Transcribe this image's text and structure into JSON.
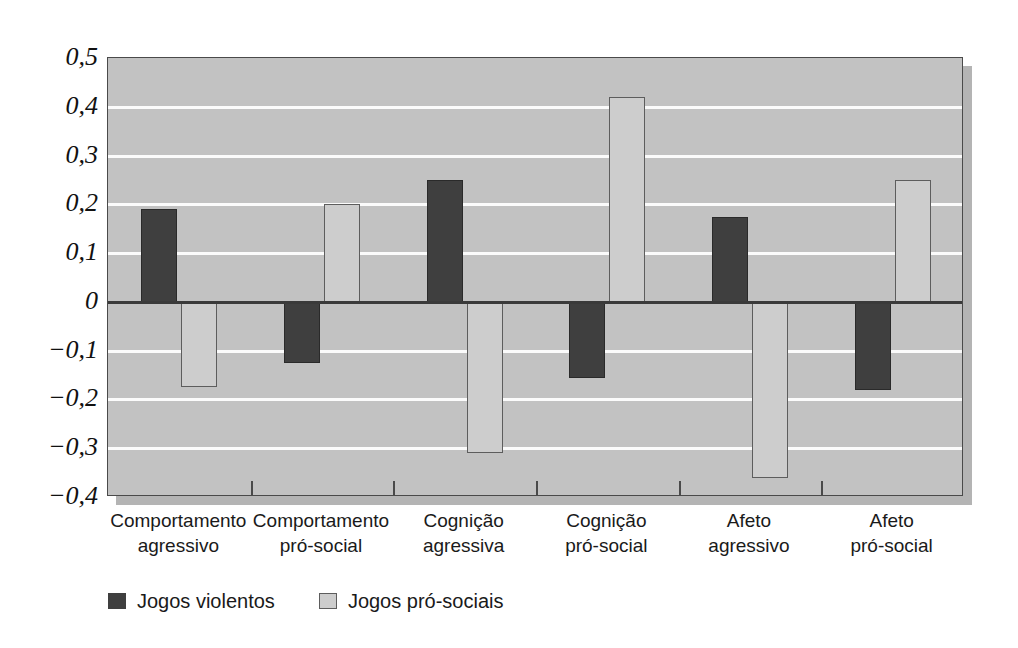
{
  "chart_data": {
    "type": "bar",
    "title": "",
    "xlabel": "",
    "ylabel": "",
    "ylim": [
      -0.4,
      0.5
    ],
    "grid": true,
    "legend_position": "bottom-left",
    "decimal_separator": ",",
    "categories": [
      {
        "line1": "Comportamento",
        "line2": "agressivo"
      },
      {
        "line1": "Comportamento",
        "line2": "pró-social"
      },
      {
        "line1": "Cognição",
        "line2": "agressiva"
      },
      {
        "line1": "Cognição",
        "line2": "pró-social"
      },
      {
        "line1": "Afeto",
        "line2": "agressivo"
      },
      {
        "line1": "Afeto",
        "line2": "pró-social"
      }
    ],
    "series": [
      {
        "name": "Jogos violentos",
        "color": "#3f3f3f",
        "values": [
          0.19,
          -0.125,
          0.25,
          -0.155,
          0.175,
          -0.18
        ]
      },
      {
        "name": "Jogos pró-sociais",
        "color": "#cdcdcd",
        "values": [
          -0.175,
          0.2,
          -0.31,
          0.42,
          -0.36,
          0.25
        ]
      }
    ],
    "yticks": [
      {
        "value": 0.5,
        "label": "0,5"
      },
      {
        "value": 0.4,
        "label": "0,4"
      },
      {
        "value": 0.3,
        "label": "0,3"
      },
      {
        "value": 0.2,
        "label": "0,2"
      },
      {
        "value": 0.1,
        "label": "0,1"
      },
      {
        "value": 0.0,
        "label": "0"
      },
      {
        "value": -0.1,
        "label": "−0,1"
      },
      {
        "value": -0.2,
        "label": "−0,2"
      },
      {
        "value": -0.3,
        "label": "−0,3"
      },
      {
        "value": -0.4,
        "label": "−0,4"
      }
    ]
  },
  "legend": {
    "items": [
      {
        "label": "Jogos violentos",
        "swatch": "dark"
      },
      {
        "label": "Jogos pró-sociais",
        "swatch": "light"
      }
    ]
  }
}
